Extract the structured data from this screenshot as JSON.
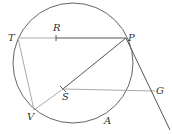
{
  "diagram": {
    "type": "geometry",
    "circle": {
      "cx": 73,
      "cy": 63,
      "r": 60
    },
    "points": {
      "T": {
        "label": "T",
        "x": 18,
        "y": 38
      },
      "R": {
        "label": "R",
        "x": 56,
        "y": 38
      },
      "P": {
        "label": "P",
        "x": 126,
        "y": 38
      },
      "S": {
        "label": "S",
        "x": 63,
        "y": 89
      },
      "G": {
        "label": "G",
        "x": 155,
        "y": 91
      },
      "V": {
        "label": "V",
        "x": 34,
        "y": 110
      },
      "A": {
        "label": "A",
        "x": 107,
        "y": 121
      }
    },
    "segments": [
      [
        "T",
        "P"
      ],
      [
        "T",
        "V"
      ],
      [
        "V",
        "P"
      ],
      [
        "S",
        "G"
      ]
    ],
    "tangent_line": {
      "from": "P",
      "to": [
        170,
        130
      ]
    },
    "colors": {
      "stroke_dark": "#555555",
      "stroke_light": "#aaaaaa",
      "text": "#333333"
    }
  }
}
